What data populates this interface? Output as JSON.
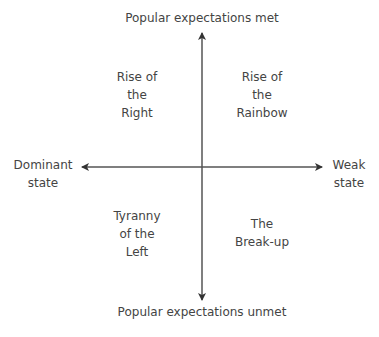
{
  "axes": {
    "top": "Popular expectations met",
    "bottom": "Popular expectations unmet",
    "left_line1": "Dominant",
    "left_line2": "state",
    "right_line1": "Weak",
    "right_line2": "state"
  },
  "quadrants": {
    "top_left": [
      "Rise of",
      "the",
      "Right"
    ],
    "top_right": [
      "Rise of",
      "the",
      "Rainbow"
    ],
    "bottom_left": [
      "Tyranny",
      "of the",
      "Left"
    ],
    "bottom_right": [
      "The",
      "Break-up"
    ]
  },
  "colors": {
    "axis": "#555555",
    "text": "#444444"
  }
}
